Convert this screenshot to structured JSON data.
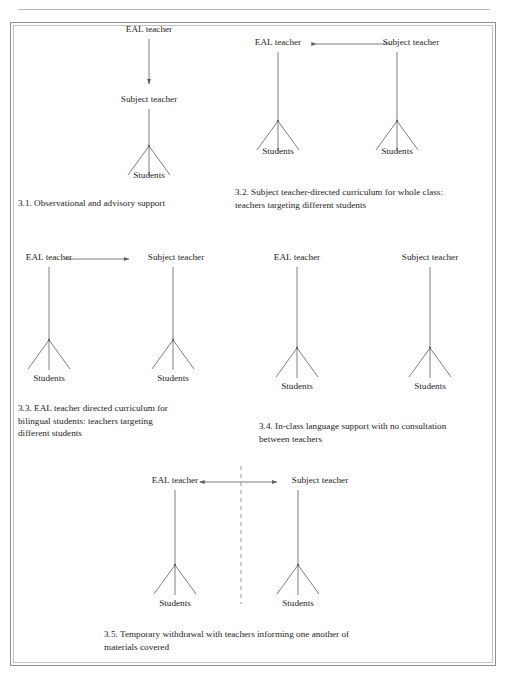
{
  "page": {
    "header_text": "",
    "frame_color": "#8e8e8e",
    "line_color": "#6f6f6f",
    "text_color": "#242424"
  },
  "figure": {
    "diagrams": [
      {
        "id": "3.1",
        "caption": "3.1. Observational and advisory support",
        "nodes": {
          "top": "EAL teacher",
          "middle": "Subject teacher",
          "bottom": "Students"
        },
        "arrow": {
          "type": "vertical-down",
          "from": "EAL teacher",
          "to": "Subject teacher",
          "heads": "single-down"
        }
      },
      {
        "id": "3.2",
        "caption_line1": "3.2.  Subject teacher-directed curriculum for whole class:",
        "caption_line2": "teachers targeting different students",
        "nodes": {
          "left_top": "EAL teacher",
          "right_top": "Subject teacher",
          "left_bottom": "Students",
          "right_bottom": "Students"
        },
        "arrow": {
          "type": "horizontal",
          "from": "Subject teacher",
          "to": "EAL teacher",
          "heads": "single-left"
        }
      },
      {
        "id": "3.3",
        "caption_line1": "3.3. EAL teacher directed curriculum for",
        "caption_line2": "bilingual students: teachers targeting",
        "caption_line3": "different students",
        "nodes": {
          "left_top": "EAL teacher",
          "right_top": "Subject teacher",
          "left_bottom": "Students",
          "right_bottom": "Students"
        },
        "arrow": {
          "type": "horizontal",
          "from": "EAL teacher",
          "to": "Subject teacher",
          "heads": "single-right"
        }
      },
      {
        "id": "3.4",
        "caption_line1": "3.4. In-class language support with no consultation",
        "caption_line2": "between teachers",
        "nodes": {
          "left_top": "EAL teacher",
          "right_top": "Subject teacher",
          "left_bottom": "Students",
          "right_bottom": "Students"
        },
        "arrow": {
          "type": "none",
          "heads": "none"
        }
      },
      {
        "id": "3.5",
        "caption_line1": "3.5. Temporary withdrawal with teachers informing one another of",
        "caption_line2": "materials covered",
        "nodes": {
          "left_top": "EAL teacher",
          "right_top": "Subject teacher",
          "left_bottom": "Students",
          "right_bottom": "Students"
        },
        "arrow": {
          "type": "horizontal",
          "from": "EAL teacher",
          "to": "Subject teacher",
          "heads": "double"
        },
        "divider": "vertical-dashed"
      }
    ]
  }
}
